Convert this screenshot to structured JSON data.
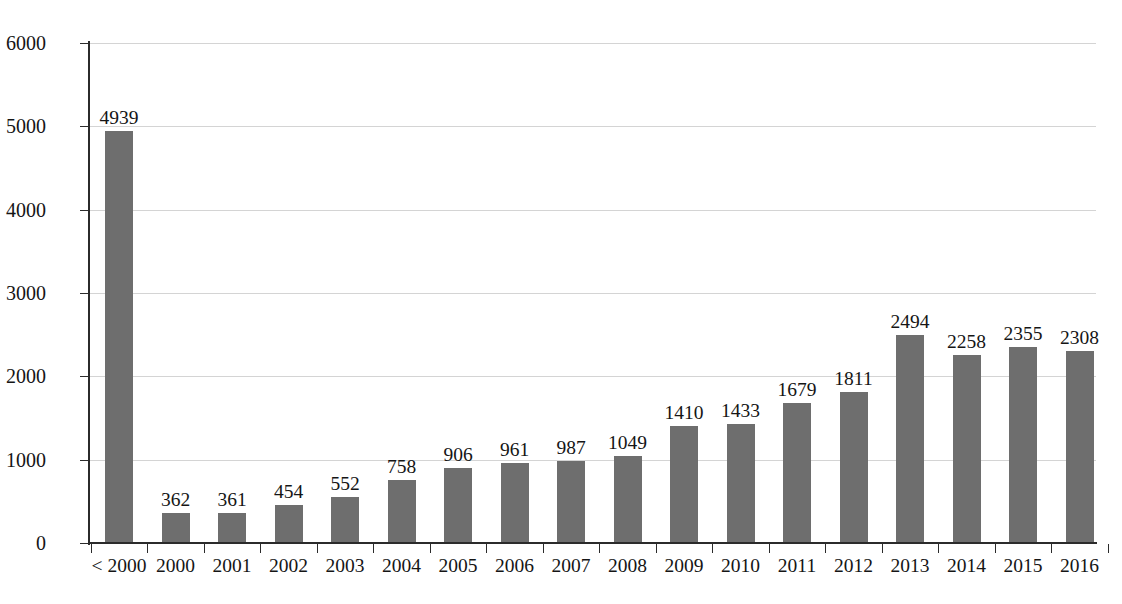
{
  "chart_data": {
    "type": "bar",
    "title": "",
    "xlabel": "",
    "ylabel": "",
    "categories": [
      "< 2000",
      "2000",
      "2001",
      "2002",
      "2003",
      "2004",
      "2005",
      "2006",
      "2007",
      "2008",
      "2009",
      "2010",
      "2011",
      "2012",
      "2013",
      "2014",
      "2015",
      "2016"
    ],
    "values": [
      4939,
      362,
      361,
      454,
      552,
      758,
      906,
      961,
      987,
      1049,
      1410,
      1433,
      1679,
      1811,
      2494,
      2258,
      2355,
      2308
    ],
    "ylim": [
      0,
      6000
    ],
    "yticks": [
      0,
      1000,
      2000,
      3000,
      4000,
      5000,
      6000
    ],
    "ytick_labels": [
      "0",
      "1000",
      "2000",
      "3000",
      "4000",
      "5000",
      "6000"
    ],
    "grid": true,
    "legend": false,
    "data_labels": true,
    "bar_color": "#6e6e6e",
    "grid_color": "#d4d4d4",
    "axis_color": "#2b2b2b",
    "background": "#ffffff"
  }
}
